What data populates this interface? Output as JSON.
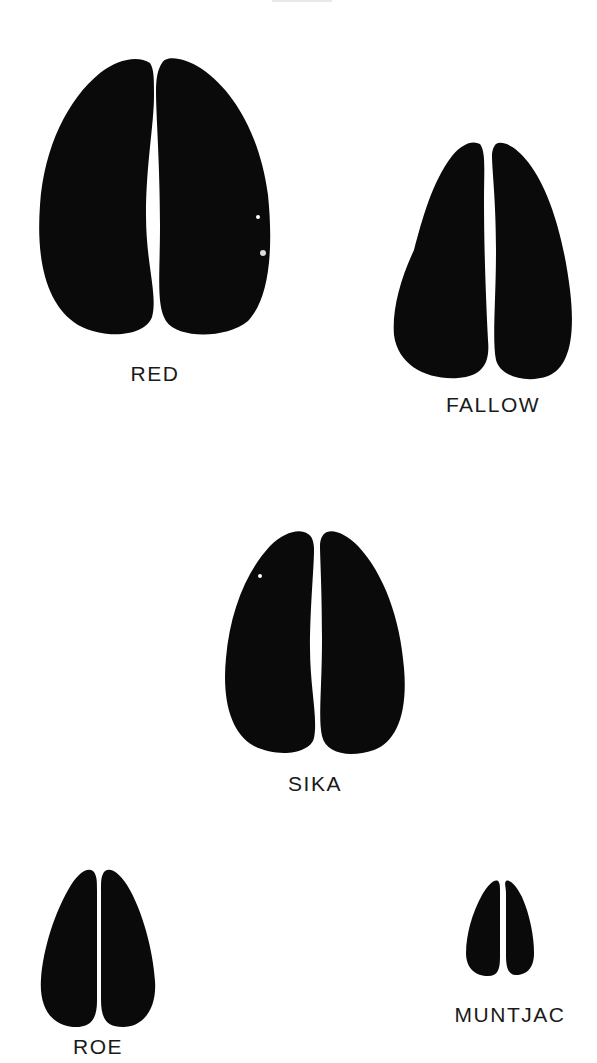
{
  "title_fragment": "",
  "ink_color": "#0a0a0a",
  "tracks": [
    {
      "id": "red",
      "label": "RED"
    },
    {
      "id": "fallow",
      "label": "FALLOW"
    },
    {
      "id": "sika",
      "label": "SIKA"
    },
    {
      "id": "roe",
      "label": "ROE"
    },
    {
      "id": "muntjac",
      "label": "MUNTJAC"
    }
  ]
}
